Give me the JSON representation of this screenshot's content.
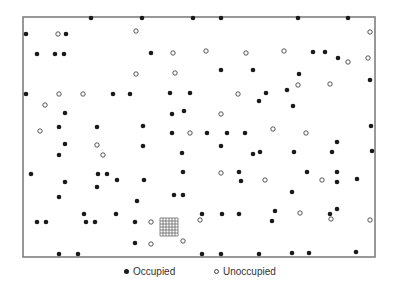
{
  "chart_data": {
    "type": "scatter",
    "title": "",
    "xlabel": "",
    "ylabel": "",
    "grid": false,
    "legend_position": "bottom",
    "frame": {
      "x0": 23,
      "y0": 17,
      "x1": 375,
      "y1": 257
    },
    "colors": {
      "frame": "#777777",
      "filled": "#1a1a1a",
      "open_stroke": "#444444",
      "grid": "#555555"
    },
    "sample_grid": {
      "x0": 160,
      "y0": 218,
      "x1": 178,
      "y1": 236,
      "divisions": 6
    },
    "series": [
      {
        "name": "Occupied",
        "marker": "filled-circle",
        "points": [
          [
            91,
            18
          ],
          [
            142,
            18
          ],
          [
            193,
            18
          ],
          [
            221,
            18
          ],
          [
            298,
            18
          ],
          [
            348,
            18
          ],
          [
            26,
            34
          ],
          [
            66,
            34
          ],
          [
            37,
            54
          ],
          [
            55,
            54
          ],
          [
            64,
            54
          ],
          [
            151,
            53
          ],
          [
            313,
            52
          ],
          [
            325,
            52
          ],
          [
            338,
            58
          ],
          [
            221,
            70
          ],
          [
            253,
            70
          ],
          [
            299,
            74
          ],
          [
            370,
            80
          ],
          [
            26,
            94
          ],
          [
            113,
            94
          ],
          [
            130,
            94
          ],
          [
            170,
            93
          ],
          [
            190,
            93
          ],
          [
            266,
            93
          ],
          [
            287,
            90
          ],
          [
            259,
            101
          ],
          [
            293,
            106
          ],
          [
            172,
            114
          ],
          [
            184,
            111
          ],
          [
            65,
            113
          ],
          [
            59,
            127
          ],
          [
            97,
            127
          ],
          [
            143,
            126
          ],
          [
            172,
            133
          ],
          [
            207,
            133
          ],
          [
            227,
            133
          ],
          [
            245,
            133
          ],
          [
            371,
            126
          ],
          [
            65,
            144
          ],
          [
            143,
            146
          ],
          [
            221,
            146
          ],
          [
            337,
            142
          ],
          [
            59,
            155
          ],
          [
            182,
            153
          ],
          [
            253,
            154
          ],
          [
            260,
            152
          ],
          [
            294,
            152
          ],
          [
            332,
            152
          ],
          [
            372,
            151
          ],
          [
            31,
            174
          ],
          [
            98,
            174
          ],
          [
            107,
            174
          ],
          [
            183,
            172
          ],
          [
            239,
            172
          ],
          [
            307,
            172
          ],
          [
            337,
            172
          ],
          [
            65,
            182
          ],
          [
            117,
            180
          ],
          [
            144,
            180
          ],
          [
            241,
            181
          ],
          [
            337,
            182
          ],
          [
            357,
            179
          ],
          [
            97,
            187
          ],
          [
            59,
            197
          ],
          [
            137,
            201
          ],
          [
            174,
            195
          ],
          [
            183,
            195
          ],
          [
            292,
            192
          ],
          [
            84,
            214
          ],
          [
            116,
            214
          ],
          [
            202,
            214
          ],
          [
            222,
            214
          ],
          [
            239,
            214
          ],
          [
            275,
            211
          ],
          [
            330,
            214
          ],
          [
            337,
            209
          ],
          [
            37,
            222
          ],
          [
            46,
            222
          ],
          [
            86,
            222
          ],
          [
            95,
            222
          ],
          [
            135,
            222
          ],
          [
            272,
            221
          ],
          [
            135,
            243
          ],
          [
            59,
            254
          ],
          [
            78,
            254
          ],
          [
            202,
            254
          ],
          [
            221,
            254
          ],
          [
            259,
            254
          ],
          [
            292,
            253
          ],
          [
            309,
            253
          ],
          [
            356,
            252
          ]
        ]
      },
      {
        "name": "Unoccupied",
        "marker": "open-circle",
        "points": [
          [
            58,
            34
          ],
          [
            136,
            31
          ],
          [
            370,
            32
          ],
          [
            173,
            53
          ],
          [
            206,
            51
          ],
          [
            246,
            53
          ],
          [
            284,
            51
          ],
          [
            348,
            62
          ],
          [
            368,
            58
          ],
          [
            136,
            74
          ],
          [
            175,
            73
          ],
          [
            59,
            94
          ],
          [
            83,
            94
          ],
          [
            238,
            94
          ],
          [
            298,
            85
          ],
          [
            330,
            84
          ],
          [
            45,
            105
          ],
          [
            221,
            114
          ],
          [
            40,
            131
          ],
          [
            190,
            133
          ],
          [
            273,
            129
          ],
          [
            306,
            133
          ],
          [
            97,
            145
          ],
          [
            103,
            155
          ],
          [
            221,
            173
          ],
          [
            265,
            180
          ],
          [
            322,
            180
          ],
          [
            300,
            213
          ],
          [
            151,
            222
          ],
          [
            200,
            220
          ],
          [
            331,
            219
          ],
          [
            370,
            220
          ],
          [
            151,
            244
          ],
          [
            183,
            241
          ]
        ]
      }
    ]
  },
  "legend": {
    "items": [
      {
        "label": "Occupied",
        "symbol": "filled-circle"
      },
      {
        "label": "Unoccupied",
        "symbol": "open-circle"
      }
    ]
  }
}
